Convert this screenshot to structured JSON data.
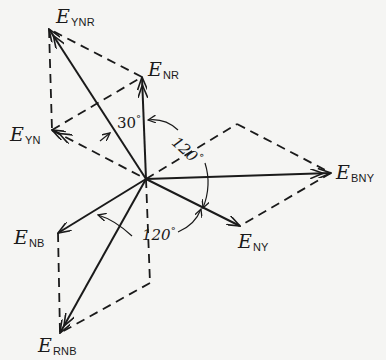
{
  "diagram": {
    "type": "phasor-diagram",
    "origin": {
      "x": 146,
      "y": 179
    },
    "phasors": [
      {
        "id": "E_NR",
        "label_main": "E",
        "label_sub": "NR",
        "tip": {
          "x": 142,
          "y": 77
        },
        "style": "solid"
      },
      {
        "id": "E_YN",
        "label_main": "E",
        "label_sub": "YN",
        "tip": {
          "x": 52,
          "y": 130
        },
        "style": "solid"
      },
      {
        "id": "E_YNR",
        "label_main": "E",
        "label_sub": "YNR",
        "tip": {
          "x": 49,
          "y": 29
        },
        "style": "solid"
      },
      {
        "id": "E_NY",
        "label_main": "E",
        "label_sub": "NY",
        "tip": {
          "x": 240,
          "y": 226
        },
        "style": "solid"
      },
      {
        "id": "E_BNY",
        "label_main": "E",
        "label_sub": "BNY",
        "tip": {
          "x": 331,
          "y": 173
        },
        "style": "solid"
      },
      {
        "id": "E_NB",
        "label_main": "E",
        "label_sub": "NB",
        "tip": {
          "x": 58,
          "y": 233
        },
        "style": "solid"
      },
      {
        "id": "E_RNB",
        "label_main": "E",
        "label_sub": "RNB",
        "tip": {
          "x": 60,
          "y": 333
        },
        "style": "solid"
      }
    ],
    "angles": [
      {
        "id": "angle-30",
        "text": "30",
        "unit": "°"
      },
      {
        "id": "angle-120-upper",
        "text": "120",
        "unit": "°"
      },
      {
        "id": "angle-120-lower",
        "text": "120",
        "unit": "°"
      }
    ],
    "construction_lines": "dashed parallelograms completing vector sums"
  }
}
